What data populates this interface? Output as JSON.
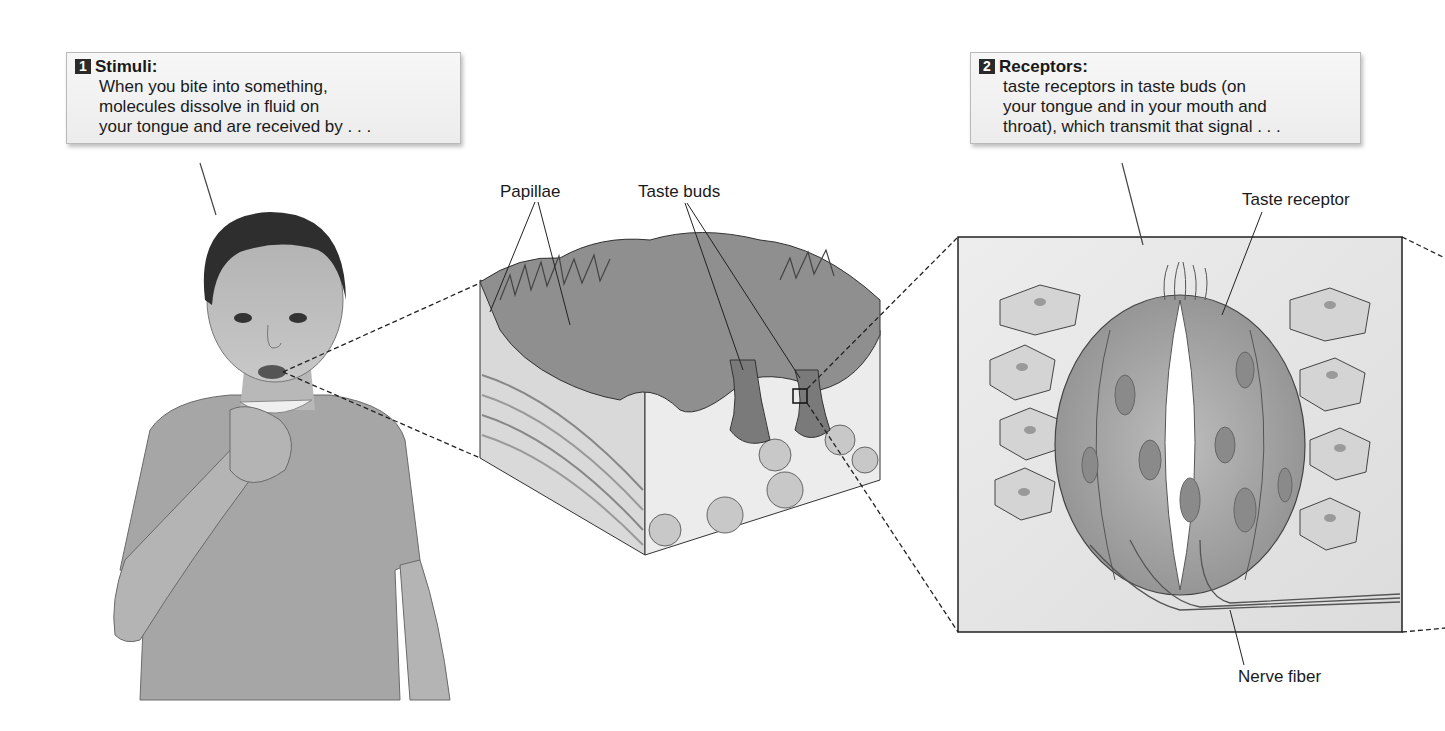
{
  "callouts": [
    {
      "number": "1",
      "title": "Stimuli:",
      "lines": [
        "When you bite into something,",
        "molecules dissolve in fluid on",
        "your tongue and are received by . . ."
      ]
    },
    {
      "number": "2",
      "title": "Receptors:",
      "lines": [
        "taste receptors in taste buds (on",
        "your tongue and in your mouth and",
        "throat), which transmit that signal . . ."
      ]
    }
  ],
  "labels": {
    "papillae": "Papillae",
    "taste_buds": "Taste buds",
    "taste_receptor": "Taste receptor",
    "nerve_fiber": "Nerve fiber"
  },
  "colors": {
    "callout_bg": "#efefef",
    "badge_bg": "#2a2a2a",
    "tissue_dark": "#7a7a7a",
    "tissue_mid": "#a8a8a8",
    "tissue_light": "#d8d8d8",
    "line": "#333333"
  }
}
